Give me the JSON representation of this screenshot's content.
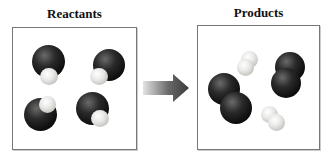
{
  "reactants": {
    "title": "Reactants",
    "molecules": [
      {
        "type": "CO",
        "description": "dark large atom with small light atom"
      },
      {
        "type": "CO",
        "description": "dark large atom with small light atom"
      },
      {
        "type": "CO",
        "description": "dark large atom with small light atom"
      },
      {
        "type": "CO",
        "description": "dark large atom with small light atom"
      }
    ]
  },
  "arrow": {
    "direction": "right",
    "gradient_from": "#e0e0e0",
    "gradient_to": "#3a3a3a"
  },
  "products": {
    "title": "Products",
    "molecules": [
      {
        "type": "dark diatomic",
        "count": 2
      },
      {
        "type": "light diatomic",
        "count": 2
      }
    ]
  },
  "colors": {
    "dark_atom": "#111111",
    "light_atom": "#d8d8d4",
    "border": "#777777"
  }
}
